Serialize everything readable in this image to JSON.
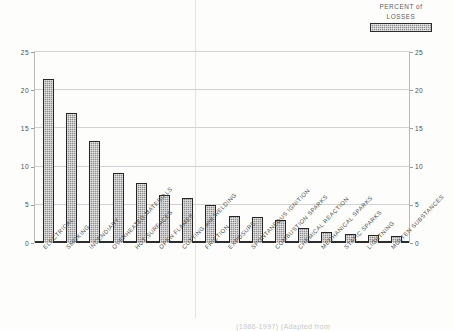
{
  "legend": {
    "line1": "PERCENT of",
    "line2": "LOSSES",
    "swatch_name": "dotted-pattern-swatch",
    "swatch_color": "#8e8e8e"
  },
  "footer": {
    "note": "(1986-1997)  (Adapted from"
  },
  "chart_data": {
    "type": "bar",
    "title": "",
    "xlabel": "",
    "ylabel": "",
    "ylim": [
      0,
      25
    ],
    "yticks": [
      0,
      5,
      10,
      15,
      20,
      25
    ],
    "ytick_labels_left": [
      "25",
      "20",
      "15",
      "10",
      "5",
      "0"
    ],
    "ytick_labels_right": [
      "25",
      "20",
      "15",
      "10",
      "5",
      "0"
    ],
    "grid": true,
    "legend_position": "top-right",
    "series_name": "PERCENT of LOSSES",
    "bar_color": "#8d8d8d",
    "bar_edge_color": "#252525",
    "categories": [
      "ELECTRICAL",
      "SMOKING",
      "INCENDIARY",
      "OVERHEATED MATERIALS",
      "HOT SURFACES",
      "OPEN FLAMES",
      "CUTTING and WELDING",
      "FRICTION",
      "EXPOSURE",
      "SPONTANEOUS IGNITION",
      "COMBUSTION SPARKS",
      "CHEMICAL REACTION",
      "MECHANICAL SPARKS",
      "STATIC SPARKS",
      "LIGHTNING",
      "MOLTEN SUBSTANCES"
    ],
    "values": [
      21.5,
      17.0,
      13.4,
      9.2,
      7.8,
      6.3,
      5.9,
      5.0,
      3.5,
      3.4,
      3.0,
      2.0,
      1.4,
      1.2,
      1.1,
      0.9
    ]
  }
}
